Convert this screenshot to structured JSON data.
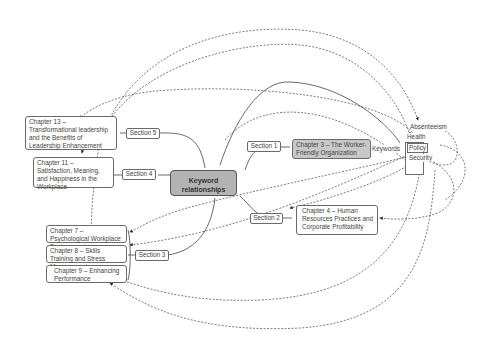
{
  "center": {
    "label": "Keyword relationships"
  },
  "sections": [
    {
      "label": "Section 1"
    },
    {
      "label": "Section 2"
    },
    {
      "label": "Section 3"
    },
    {
      "label": "Section 4"
    },
    {
      "label": "Section 5"
    }
  ],
  "chapters": {
    "ch3": "Chapter 3 – The Worker-Friendly Organization",
    "ch4": "Chapter 4 – Human Resources Practices and Corporate Profitability",
    "ch7": "Chapter 7 – Psychological Workplace Environment",
    "ch8": "Chapter 8 – Skills Training and Stress Management",
    "ch9": "Chapter 9 – Enhancing Performance",
    "ch11": "Chapter 11 – Satisfaction, Meaning, and Happiness in the Workplace",
    "ch13": "Chapter 13 – Transformational leadership and the Benefits of Leadership Enhancement"
  },
  "keywords": {
    "label": "Keywords",
    "items": [
      "Absenteeism",
      "Health",
      "Policy",
      "Security"
    ]
  }
}
